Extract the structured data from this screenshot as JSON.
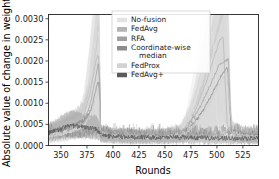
{
  "figure": {
    "background": "#ffffff",
    "frame_color": "#222222"
  },
  "chart_data": {
    "type": "line",
    "title": "",
    "xlabel": "Rounds",
    "ylabel": "Absolute value of change in weights",
    "xlim": [
      338,
      540
    ],
    "ylim": [
      0.0,
      0.0031
    ],
    "xticks": [
      350,
      375,
      400,
      425,
      450,
      475,
      500,
      525
    ],
    "xtick_labels": [
      "350",
      "375",
      "400",
      "425",
      "450",
      "475",
      "500",
      "525"
    ],
    "yticks": [
      0.0,
      0.0005,
      0.001,
      0.0015,
      0.002,
      0.0025,
      0.003
    ],
    "ytick_labels": [
      "0.0000",
      "0.0005",
      "0.0010",
      "0.0015",
      "0.0020",
      "0.0025",
      "0.0030"
    ],
    "grid": false,
    "legend_position": "upper center-left",
    "bands": "shaded confidence interval around each mean line",
    "series": [
      {
        "name": "No-fusion",
        "color": "#e2e2e2",
        "band_color": "#ededed",
        "points": [
          {
            "x": 338,
            "y": 0.00022
          },
          {
            "x": 345,
            "y": 0.00026
          },
          {
            "x": 352,
            "y": 0.0003
          },
          {
            "x": 360,
            "y": 0.00034
          },
          {
            "x": 368,
            "y": 0.00042
          },
          {
            "x": 374,
            "y": 0.00075
          },
          {
            "x": 378,
            "y": 0.00135
          },
          {
            "x": 381,
            "y": 0.00195
          },
          {
            "x": 384,
            "y": 0.00252
          },
          {
            "x": 386,
            "y": 0.00275
          },
          {
            "x": 387.5,
            "y": 0.0018
          },
          {
            "x": 388,
            "y": 0.0003
          },
          {
            "x": 395,
            "y": 0.00022
          },
          {
            "x": 410,
            "y": 0.0002
          },
          {
            "x": 430,
            "y": 0.00019
          },
          {
            "x": 450,
            "y": 0.0002
          },
          {
            "x": 462,
            "y": 0.00024
          },
          {
            "x": 470,
            "y": 0.00045
          },
          {
            "x": 478,
            "y": 0.00095
          },
          {
            "x": 484,
            "y": 0.0015
          },
          {
            "x": 490,
            "y": 0.00215
          },
          {
            "x": 494,
            "y": 0.00262
          },
          {
            "x": 496,
            "y": 0.00272
          },
          {
            "x": 498,
            "y": 0.0019
          },
          {
            "x": 500,
            "y": 0.0006
          },
          {
            "x": 505,
            "y": 0.00028
          },
          {
            "x": 520,
            "y": 0.00022
          },
          {
            "x": 540,
            "y": 0.00021
          }
        ]
      },
      {
        "name": "FedAvg",
        "color": "#b4b4b4",
        "band_color": "#d8d8d8",
        "points": [
          {
            "x": 338,
            "y": 0.00024
          },
          {
            "x": 348,
            "y": 0.0003
          },
          {
            "x": 358,
            "y": 0.00038
          },
          {
            "x": 366,
            "y": 0.00046
          },
          {
            "x": 372,
            "y": 0.0007
          },
          {
            "x": 377,
            "y": 0.00115
          },
          {
            "x": 381,
            "y": 0.00165
          },
          {
            "x": 384,
            "y": 0.00205
          },
          {
            "x": 386,
            "y": 0.00215
          },
          {
            "x": 387.6,
            "y": 0.0014
          },
          {
            "x": 388,
            "y": 0.00028
          },
          {
            "x": 400,
            "y": 0.00021
          },
          {
            "x": 420,
            "y": 0.00019
          },
          {
            "x": 440,
            "y": 0.00019
          },
          {
            "x": 455,
            "y": 0.00021
          },
          {
            "x": 466,
            "y": 0.0003
          },
          {
            "x": 475,
            "y": 0.0006
          },
          {
            "x": 483,
            "y": 0.00105
          },
          {
            "x": 491,
            "y": 0.0016
          },
          {
            "x": 498,
            "y": 0.00215
          },
          {
            "x": 503,
            "y": 0.0025
          },
          {
            "x": 506,
            "y": 0.00258
          },
          {
            "x": 508,
            "y": 0.0015
          },
          {
            "x": 510,
            "y": 0.00045
          },
          {
            "x": 518,
            "y": 0.00024
          },
          {
            "x": 540,
            "y": 0.00022
          }
        ]
      },
      {
        "name": "RFA",
        "color": "#a0a0a0",
        "band_color": "#cfcfcf",
        "points": [
          {
            "x": 338,
            "y": 0.00026
          },
          {
            "x": 350,
            "y": 0.00033
          },
          {
            "x": 360,
            "y": 0.00042
          },
          {
            "x": 370,
            "y": 0.00052
          },
          {
            "x": 376,
            "y": 0.0008
          },
          {
            "x": 380,
            "y": 0.0012
          },
          {
            "x": 384,
            "y": 0.0017
          },
          {
            "x": 386,
            "y": 0.00195
          },
          {
            "x": 387.7,
            "y": 0.0012
          },
          {
            "x": 388,
            "y": 0.00026
          },
          {
            "x": 405,
            "y": 0.0002
          },
          {
            "x": 425,
            "y": 0.00019
          },
          {
            "x": 448,
            "y": 0.0002
          },
          {
            "x": 464,
            "y": 0.00026
          },
          {
            "x": 474,
            "y": 0.0005
          },
          {
            "x": 484,
            "y": 0.00092
          },
          {
            "x": 494,
            "y": 0.00145
          },
          {
            "x": 502,
            "y": 0.0019
          },
          {
            "x": 508,
            "y": 0.002
          },
          {
            "x": 511,
            "y": 0.00205
          },
          {
            "x": 512.5,
            "y": 0.0011
          },
          {
            "x": 514,
            "y": 0.00035
          },
          {
            "x": 525,
            "y": 0.00023
          },
          {
            "x": 540,
            "y": 0.00022
          }
        ]
      },
      {
        "name": "Coordinate-wise median",
        "color": "#8c8c8c",
        "band_color": "#c4c4c4",
        "points": [
          {
            "x": 338,
            "y": 0.00028
          },
          {
            "x": 352,
            "y": 0.00038
          },
          {
            "x": 362,
            "y": 0.00048
          },
          {
            "x": 372,
            "y": 0.00058
          },
          {
            "x": 379,
            "y": 0.00085
          },
          {
            "x": 383,
            "y": 0.00125
          },
          {
            "x": 386,
            "y": 0.00155
          },
          {
            "x": 387.8,
            "y": 0.0009
          },
          {
            "x": 388,
            "y": 0.00025
          },
          {
            "x": 408,
            "y": 0.0002
          },
          {
            "x": 432,
            "y": 0.00019
          },
          {
            "x": 452,
            "y": 0.00021
          },
          {
            "x": 468,
            "y": 0.00028
          },
          {
            "x": 478,
            "y": 0.00052
          },
          {
            "x": 488,
            "y": 0.00088
          },
          {
            "x": 497,
            "y": 0.0013
          },
          {
            "x": 505,
            "y": 0.0017
          },
          {
            "x": 510,
            "y": 0.00185
          },
          {
            "x": 512,
            "y": 0.001
          },
          {
            "x": 514,
            "y": 0.00032
          },
          {
            "x": 528,
            "y": 0.00023
          },
          {
            "x": 540,
            "y": 0.00022
          }
        ]
      },
      {
        "name": "FedProx",
        "color": "#d2d2d2",
        "band_color": "#e4e4e4",
        "points": [
          {
            "x": 338,
            "y": 0.00023
          },
          {
            "x": 350,
            "y": 0.00029
          },
          {
            "x": 362,
            "y": 0.00036
          },
          {
            "x": 372,
            "y": 0.00046
          },
          {
            "x": 378,
            "y": 0.00068
          },
          {
            "x": 383,
            "y": 0.00105
          },
          {
            "x": 386,
            "y": 0.00135
          },
          {
            "x": 387.9,
            "y": 0.0007
          },
          {
            "x": 388,
            "y": 0.00024
          },
          {
            "x": 412,
            "y": 0.0002
          },
          {
            "x": 436,
            "y": 0.00019
          },
          {
            "x": 456,
            "y": 0.00021
          },
          {
            "x": 470,
            "y": 0.0003
          },
          {
            "x": 482,
            "y": 0.00058
          },
          {
            "x": 492,
            "y": 0.00095
          },
          {
            "x": 500,
            "y": 0.00135
          },
          {
            "x": 507,
            "y": 0.00165
          },
          {
            "x": 510,
            "y": 0.00172
          },
          {
            "x": 512.5,
            "y": 0.0009
          },
          {
            "x": 515,
            "y": 0.0003
          },
          {
            "x": 530,
            "y": 0.00022
          },
          {
            "x": 540,
            "y": 0.00021
          }
        ]
      },
      {
        "name": "FedAvg+",
        "color": "#5a5a5a",
        "band_color": "#9a9a9a",
        "points": [
          {
            "x": 338,
            "y": 0.0003
          },
          {
            "x": 346,
            "y": 0.00036
          },
          {
            "x": 354,
            "y": 0.00044
          },
          {
            "x": 360,
            "y": 0.00048
          },
          {
            "x": 368,
            "y": 0.00044
          },
          {
            "x": 376,
            "y": 0.00042
          },
          {
            "x": 384,
            "y": 0.0004
          },
          {
            "x": 388,
            "y": 0.00026
          },
          {
            "x": 396,
            "y": 0.00022
          },
          {
            "x": 406,
            "y": 0.00021
          },
          {
            "x": 418,
            "y": 0.0002
          },
          {
            "x": 430,
            "y": 0.0002
          },
          {
            "x": 442,
            "y": 0.00019
          },
          {
            "x": 454,
            "y": 0.00019
          },
          {
            "x": 466,
            "y": 0.00019
          },
          {
            "x": 478,
            "y": 0.00018
          },
          {
            "x": 490,
            "y": 0.00018
          },
          {
            "x": 502,
            "y": 0.00017
          },
          {
            "x": 514,
            "y": 0.00017
          },
          {
            "x": 526,
            "y": 0.00017
          },
          {
            "x": 540,
            "y": 0.00017
          }
        ]
      }
    ]
  },
  "legend": {
    "entries": [
      {
        "label": "No-fusion",
        "swatch": "#e2e2e2"
      },
      {
        "label": "FedAvg",
        "swatch": "#b4b4b4"
      },
      {
        "label": "RFA",
        "swatch": "#a0a0a0"
      },
      {
        "label": "Coordinate-wise",
        "label2": "median",
        "swatch": "#8c8c8c"
      },
      {
        "label": "FedProx",
        "swatch": "#d2d2d2"
      },
      {
        "label": "FedAvg+",
        "swatch": "#5a5a5a"
      }
    ]
  }
}
